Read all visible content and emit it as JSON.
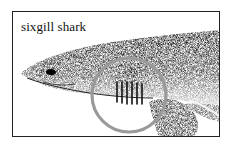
{
  "figure": {
    "caption": "sixgill shark",
    "highlight": {
      "shape": "circle",
      "target": "gill slits",
      "color": "#9a9a9a"
    },
    "gill_slit_count": 6,
    "colors": {
      "border": "#222222",
      "ink": "#1a1a1a",
      "belly": "#f2f2f2"
    }
  }
}
